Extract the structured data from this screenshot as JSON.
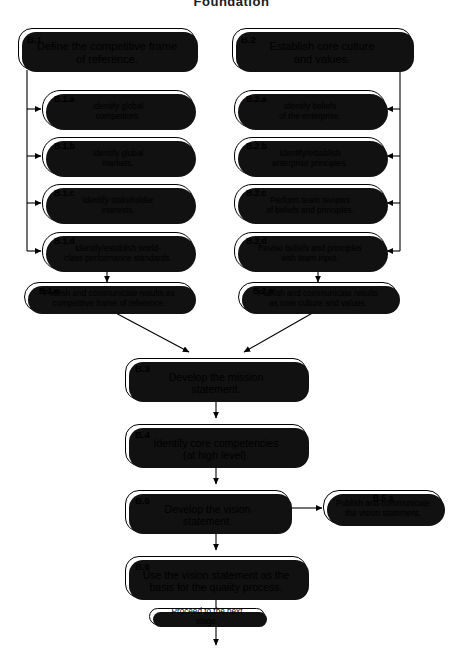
{
  "diagram": {
    "title": "Foundation",
    "type": "flowchart",
    "stroke_color": "#000000",
    "fill_color": "#ffffff",
    "shadow_color": "#111111"
  },
  "nodes": {
    "b1": {
      "tag": "B.1",
      "text": "Define the competitive frame\nof reference."
    },
    "b1a": {
      "tag": "B.1.a",
      "text": "Identify global\ncompetitors."
    },
    "b1b": {
      "tag": "B.1.b",
      "text": "Identify global\nmarkets."
    },
    "b1c": {
      "tag": "B.1.c",
      "text": "Identify stakeholder\ninterests."
    },
    "b1d": {
      "tag": "B.1.d",
      "text": "Identify/establish world-\nclass performance standards."
    },
    "b1e": {
      "tag": "B.1.e",
      "text": "Publish and communicate results as\ncompetitive frame of reference."
    },
    "b2": {
      "tag": "B.2",
      "text": "Establish core culture\nand values."
    },
    "b2a": {
      "tag": "B.2.a",
      "text": "Identify beliefs\nof the enterprise."
    },
    "b2b": {
      "tag": "B.2.b",
      "text": "Identify/establish\nenterprise principles."
    },
    "b2c": {
      "tag": "B.2.c",
      "text": "Perform team reviews\nof beliefs and principles."
    },
    "b2d": {
      "tag": "B.2.d",
      "text": "Revise beliefs and principles\nwith team input."
    },
    "b2e": {
      "tag": "B.2.e",
      "text": "Publish and communicate results\nas core culture and values."
    },
    "b3": {
      "tag": "B.3",
      "text": "Develop the mission\nstatement."
    },
    "b4": {
      "tag": "B.4",
      "text": "Identify core competencies\n(at high level)."
    },
    "b5": {
      "tag": "B.5",
      "text": "Develop the vision\nstatement."
    },
    "b5a": {
      "tag": "B.5.a",
      "text": "Publish and communicate\nthe vision statement."
    },
    "b6": {
      "tag": "B.6",
      "text": "Use the vision statement as the\nbasis for the quality process."
    },
    "proceed": {
      "tag": "",
      "text": "Proceed to the next stage."
    }
  }
}
